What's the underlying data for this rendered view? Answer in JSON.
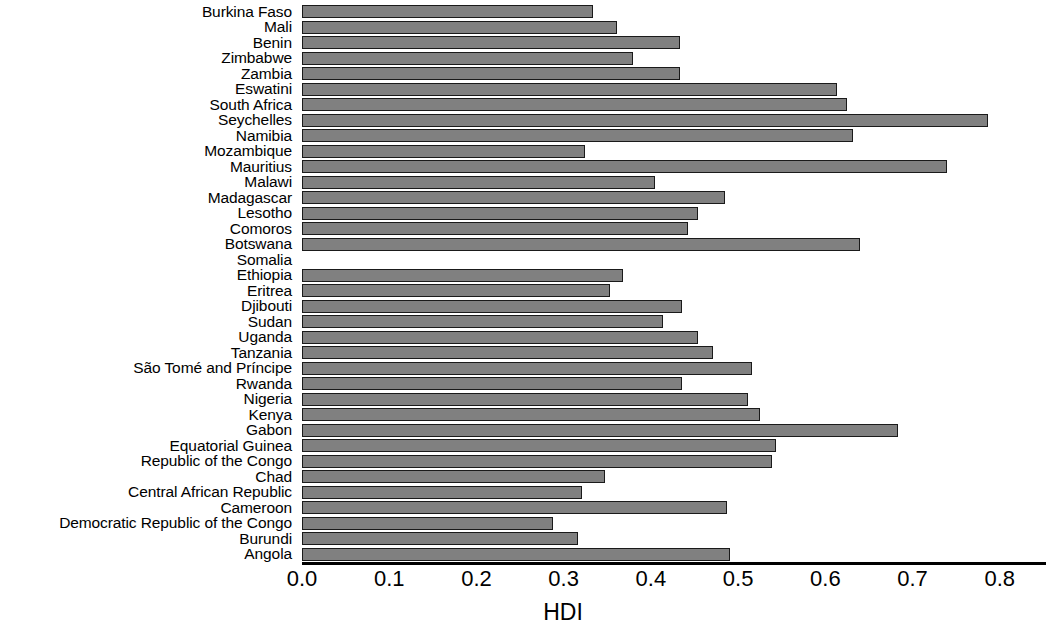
{
  "chart_data": {
    "type": "bar",
    "orientation": "horizontal",
    "title": "",
    "xlabel": "HDI",
    "ylabel": "",
    "xlim": [
      0.0,
      0.853
    ],
    "grid": false,
    "legend": null,
    "bar_color": "#808080",
    "bar_edge_color": "#1a1a1a",
    "xticks": [
      "0.0",
      "0.1",
      "0.2",
      "0.3",
      "0.4",
      "0.5",
      "0.6",
      "0.7",
      "0.8"
    ],
    "xtick_values": [
      0.0,
      0.1,
      0.2,
      0.3,
      0.4,
      0.5,
      0.6,
      0.7,
      0.8
    ],
    "categories": [
      "Burkina Faso",
      "Mali",
      "Benin",
      "Zimbabwe",
      "Zambia",
      "Eswatini",
      "South Africa",
      "Seychelles",
      "Namibia",
      "Mozambique",
      "Mauritius",
      "Malawi",
      "Madagascar",
      "Lesotho",
      "Comoros",
      "Botswana",
      "Somalia",
      "Ethiopia",
      "Eritrea",
      "Djibouti",
      "Sudan",
      "Uganda",
      "Tanzania",
      "São Tomé and Príncipe",
      "Rwanda",
      "Nigeria",
      "Kenya",
      "Gabon",
      "Equatorial Guinea",
      "Republic of the Congo",
      "Chad",
      "Central African Republic",
      "Cameroon",
      "Democratic Republic of the Congo",
      "Burundi",
      "Angola"
    ],
    "values": [
      0.334,
      0.361,
      0.433,
      0.379,
      0.433,
      0.613,
      0.625,
      0.786,
      0.632,
      0.324,
      0.739,
      0.405,
      0.485,
      0.454,
      0.442,
      0.64,
      null,
      0.368,
      0.353,
      0.436,
      0.414,
      0.454,
      0.471,
      0.516,
      0.436,
      0.511,
      0.525,
      0.683,
      0.544,
      0.539,
      0.347,
      0.321,
      0.487,
      0.288,
      0.316,
      0.491
    ]
  }
}
